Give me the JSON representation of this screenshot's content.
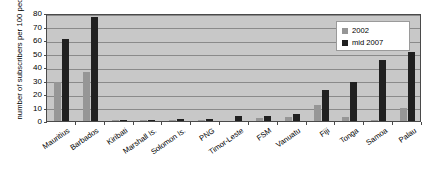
{
  "chart_data": {
    "type": "bar",
    "title": "",
    "subtitle": "",
    "xlabel": "",
    "ylabel": "number of subscribers per 100 people",
    "ylim": [
      0,
      80
    ],
    "ytick_step": 10,
    "yticks": [
      "0",
      "10",
      "20",
      "30",
      "40",
      "50",
      "60",
      "70",
      "80"
    ],
    "grid": true,
    "legend_position": "top-right",
    "categories": [
      "Mauritius",
      "Barbados",
      "Kiribati",
      "Marshall Is.",
      "Solomon Is.",
      "PNG",
      "Timor-Leste",
      "FSM",
      "Vanuatu",
      "Fiji",
      "Tonga",
      "Samoa",
      "Palau"
    ],
    "series": [
      {
        "name": "2002",
        "color": "#969696",
        "values": [
          29,
          36,
          0.4,
          0.5,
          0.2,
          0.2,
          0,
          2,
          3,
          12,
          3,
          1,
          10
        ]
      },
      {
        "name": "mid 2007",
        "color": "#202020",
        "values": [
          61,
          77,
          0.5,
          1,
          1.2,
          1.5,
          4,
          4,
          5.5,
          23,
          29,
          45,
          51
        ]
      }
    ]
  },
  "legend": {
    "items": [
      {
        "label": "2002",
        "color": "#969696"
      },
      {
        "label": "mid 2007",
        "color": "#202020"
      }
    ]
  },
  "colors": {
    "plot_background": "#c8c8c8",
    "gridline": "#8a8a8a",
    "axis": "#4a4a4a",
    "series_2002": "#969696",
    "series_mid2007": "#202020",
    "legend_background": "#ffffff",
    "page_background": "#ffffff"
  }
}
